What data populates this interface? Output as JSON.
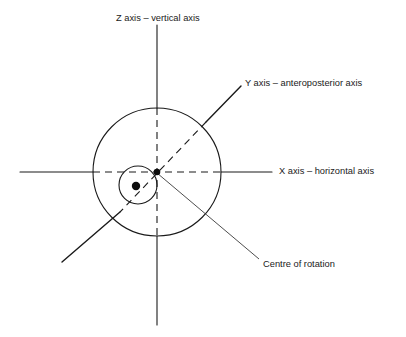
{
  "figure": {
    "title_present": false,
    "background_color": "#ffffff",
    "stroke_color": "#1a1a1a",
    "label_color": "#1a1a1a"
  },
  "labels": {
    "z_axis": "Z axis – vertical axis",
    "y_axis": "Y axis – anteroposterior axis",
    "x_axis": "X axis – horizontal axis",
    "centre_of_rotation": "Centre of rotation"
  },
  "diagram_data": {
    "type": "anatomical-axes-schematic",
    "description": "Schematic of the three orthogonal joint axes (X, Y, Z) passing through a centre of rotation, drawn over a large circle (joint head) and a small circle (articulating surface).",
    "origin": {
      "x": 157,
      "y": 172,
      "label": "centre of rotation"
    },
    "shapes": [
      {
        "name": "large-circle",
        "kind": "circle",
        "cx": 157,
        "cy": 172,
        "r": 64,
        "stroke": "#1a1a1a",
        "fill": "none",
        "stroke_width": 1.1
      },
      {
        "name": "small-circle",
        "kind": "circle",
        "cx": 138,
        "cy": 185,
        "r": 19,
        "stroke": "#1a1a1a",
        "fill": "none",
        "stroke_width": 1.1
      },
      {
        "name": "centre-dot",
        "kind": "filled-dot",
        "cx": 157,
        "cy": 172,
        "r": 3.3,
        "fill": "#0d0d0d"
      },
      {
        "name": "small-circle-centre-dot",
        "kind": "filled-dot",
        "cx": 136,
        "cy": 186,
        "r": 4.2,
        "fill": "#0d0d0d"
      }
    ],
    "axes": [
      {
        "name": "x-axis",
        "label": "X axis – horizontal axis",
        "orientation": "horizontal",
        "solid_segments": [
          {
            "x1": 20,
            "y1": 172,
            "x2": 93,
            "y2": 172
          },
          {
            "x1": 221,
            "y1": 172,
            "x2": 272,
            "y2": 172
          }
        ],
        "dashed_segments": [
          {
            "x1": 93,
            "y1": 172,
            "x2": 221,
            "y2": 172
          }
        ]
      },
      {
        "name": "z-axis",
        "label": "Z axis – vertical axis",
        "orientation": "vertical",
        "solid_segments": [
          {
            "x1": 157,
            "y1": 25,
            "x2": 157,
            "y2": 108
          },
          {
            "x1": 157,
            "y1": 236,
            "x2": 157,
            "y2": 325
          }
        ],
        "dashed_segments": [
          {
            "x1": 157,
            "y1": 108,
            "x2": 157,
            "y2": 236
          }
        ]
      },
      {
        "name": "y-axis",
        "label": "Y axis – anteroposterior axis",
        "orientation": "oblique",
        "solid_segments": [
          {
            "x1": 206,
            "y1": 122,
            "x2": 241,
            "y2": 86
          },
          {
            "x1": 120,
            "y1": 212,
            "x2": 62,
            "y2": 262
          }
        ],
        "dashed_segments": [
          {
            "x1": 206,
            "y1": 122,
            "x2": 120,
            "y2": 212
          }
        ]
      }
    ],
    "leader_lines": [
      {
        "name": "centre-of-rotation-leader",
        "from": {
          "x": 157,
          "y": 173
        },
        "to": {
          "x": 259,
          "y": 259
        },
        "target_label": "Centre of rotation"
      }
    ],
    "label_positions": [
      {
        "name": "z-axis-label",
        "text": "Z axis – vertical axis",
        "x": 116,
        "y": 19,
        "anchor": "start"
      },
      {
        "name": "y-axis-label",
        "text": "Y axis – anteroposterior axis",
        "x": 245,
        "y": 84,
        "anchor": "start"
      },
      {
        "name": "x-axis-label",
        "text": "X axis – horizontal axis",
        "x": 279,
        "y": 172,
        "anchor": "start"
      },
      {
        "name": "centre-of-rotation-label",
        "text": "Centre of rotation",
        "x": 263,
        "y": 265,
        "anchor": "start"
      }
    ]
  }
}
